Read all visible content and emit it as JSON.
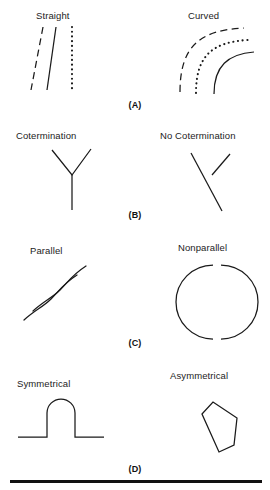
{
  "figure": {
    "title_present": false,
    "background_color": "#ffffff",
    "ink_color": "#1a1a1a",
    "width": 270,
    "height": 490
  },
  "panels": [
    {
      "letter": "(A)",
      "left_caption": "Straight",
      "right_caption": "Curved",
      "left_shapes": [
        "dashed-straight-line",
        "solid-straight-line",
        "dotted-straight-line"
      ],
      "right_shapes": [
        "dashed-arc",
        "dotted-arc",
        "solid-arc"
      ]
    },
    {
      "letter": "(B)",
      "left_caption": "Cotermination",
      "right_caption": "No Cotermination",
      "left_shapes": [
        "y-junction"
      ],
      "right_shapes": [
        "long-diagonal-line",
        "short-diagonal-line"
      ]
    },
    {
      "letter": "(C)",
      "left_caption": "Parallel",
      "right_caption": "Nonparallel",
      "left_shapes": [
        "wavy-line-upper",
        "wavy-line-lower"
      ],
      "right_shapes": [
        "circle-arc-left",
        "circle-arc-right"
      ]
    },
    {
      "letter": "(D)",
      "left_caption": "Symmetrical",
      "right_caption": "Asymmetrical",
      "left_shapes": [
        "symmetric-bump-profile"
      ],
      "right_shapes": [
        "irregular-pentagon"
      ]
    }
  ],
  "footer": {
    "rule": "horizontal-divider"
  }
}
